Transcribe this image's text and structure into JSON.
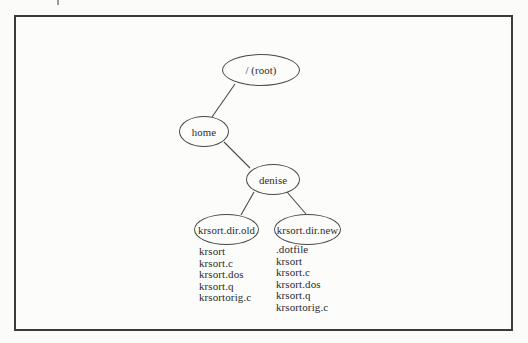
{
  "diagram": {
    "type": "tree",
    "nodes": [
      {
        "id": "root",
        "label": "/ (root)"
      },
      {
        "id": "home",
        "label": "home"
      },
      {
        "id": "denise",
        "label": "denise"
      },
      {
        "id": "krsort-dir-old",
        "label": "krsort.dir.old"
      },
      {
        "id": "krsort-dir-new",
        "label": "krsort.dir.new"
      }
    ],
    "edges": [
      {
        "from": "root",
        "to": "home"
      },
      {
        "from": "home",
        "to": "denise"
      },
      {
        "from": "denise",
        "to": "krsort-dir-old"
      },
      {
        "from": "denise",
        "to": "krsort-dir-new"
      }
    ],
    "file_lists": {
      "krsort_dir_old": [
        "krsort",
        "krsort.c",
        "krsort.dos",
        "krsort.q",
        "krsortorig.c"
      ],
      "krsort_dir_new": [
        ".dotfile",
        "krsort",
        "krsort.c",
        "krsort.dos",
        "krsort.q",
        "krsortorig.c"
      ]
    },
    "colors": {
      "ink": "#2b2b2b",
      "line": "#4a4a4a",
      "frame_border": "#3b3b3b",
      "background": "#fbfbfa"
    }
  }
}
